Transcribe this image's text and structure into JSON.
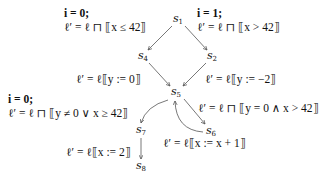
{
  "nodes": [
    {
      "id": "s1",
      "base": "s",
      "sub": "1",
      "x": 178,
      "y": 20
    },
    {
      "id": "s2",
      "base": "s",
      "sub": "2",
      "x": 212,
      "y": 57
    },
    {
      "id": "s4",
      "base": "s",
      "sub": "4",
      "x": 143,
      "y": 57
    },
    {
      "id": "s5",
      "base": "s",
      "sub": "5",
      "x": 176,
      "y": 93
    },
    {
      "id": "s6",
      "base": "s",
      "sub": "6",
      "x": 211,
      "y": 132
    },
    {
      "id": "s7",
      "base": "s",
      "sub": "7",
      "x": 141,
      "y": 131
    },
    {
      "id": "s8",
      "base": "s",
      "sub": "8",
      "x": 141,
      "y": 167
    }
  ],
  "edges": [
    {
      "from": "s1",
      "to": "s4",
      "guard": "i = 0;",
      "formula": "ℓ′ = ℓ ⊓ ⟦x ≤ 42⟧"
    },
    {
      "from": "s1",
      "to": "s2",
      "guard": "i = 1;",
      "formula": "ℓ′ = ℓ ⊓ ⟦x > 42⟧"
    },
    {
      "from": "s4",
      "to": "s5",
      "guard": "",
      "formula": "ℓ′ = ℓ⟦y := 0⟧"
    },
    {
      "from": "s2",
      "to": "s5",
      "guard": "",
      "formula": "ℓ′ = ℓ⟦y := −2⟧"
    },
    {
      "from": "s5",
      "to": "s7",
      "guard": "i = 0;",
      "formula": "ℓ′ = ℓ ⊓ ⟦y ≠ 0 ∨ x ≥ 42⟧"
    },
    {
      "from": "s5",
      "to": "s6",
      "guard": "",
      "formula": "ℓ′ = ℓ ⊓ ⟦y = 0 ∧ x > 42⟧"
    },
    {
      "from": "s6",
      "to": "s5",
      "guard": "",
      "formula": "ℓ′ = ℓ⟦x := x + 1⟧"
    },
    {
      "from": "s7",
      "to": "s8",
      "guard": "",
      "formula": "ℓ′ = ℓ⟦x := 2⟧"
    }
  ],
  "labels": {
    "s1_s4": {
      "guard": "i = 0;",
      "formula": "ℓ′ = ℓ ⊓ ⟦x ≤ 42⟧"
    },
    "s1_s2": {
      "guard": "i = 1;",
      "formula": "ℓ′ = ℓ ⊓ ⟦x > 42⟧"
    },
    "s4_s5": {
      "formula": "ℓ′ = ℓ⟦y := 0⟧"
    },
    "s2_s5": {
      "formula": "ℓ′ = ℓ⟦y := −2⟧"
    },
    "s5_s7": {
      "guard": "i = 0;",
      "formula": "ℓ′ = ℓ ⊓ ⟦y ≠ 0 ∨ x ≥ 42⟧"
    },
    "s5_s6": {
      "formula": "ℓ′ = ℓ ⊓ ⟦y = 0 ∧ x > 42⟧"
    },
    "s6_s5": {
      "formula": "ℓ′ = ℓ⟦x := x + 1⟧"
    },
    "s7_s8": {
      "formula": "ℓ′ = ℓ⟦x := 2⟧"
    }
  },
  "style": {
    "edge_color": "#555555",
    "text_color": "#111111"
  }
}
